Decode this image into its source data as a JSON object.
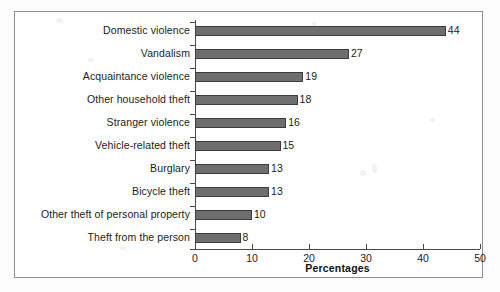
{
  "chart_data": {
    "type": "bar",
    "orientation": "horizontal",
    "title": "",
    "subtitle": "",
    "xlabel": "Percentages",
    "ylabel": "",
    "xlim": [
      0,
      50
    ],
    "xticks": [
      0,
      10,
      20,
      30,
      40,
      50
    ],
    "xtick_labels": [
      "0",
      "10",
      "20",
      "30",
      "40",
      "50"
    ],
    "grid": false,
    "legend": false,
    "legend_position": "none",
    "categories": [
      "Domestic violence",
      "Vandalism",
      "Acquaintance violence",
      "Other household theft",
      "Stranger violence",
      "Vehicle-related theft",
      "Burglary",
      "Bicycle theft",
      "Other theft of personal property",
      "Theft from the person"
    ],
    "values": [
      44,
      27,
      19,
      18,
      16,
      15,
      13,
      13,
      10,
      8
    ],
    "value_labels": [
      "44",
      "27",
      "19",
      "18",
      "16",
      "15",
      "13",
      "13",
      "10",
      "8"
    ],
    "bar_color": "#6e6e6e",
    "bar_edge_color": "#3d3d3d",
    "axis_color": "#4a4a4a",
    "text_color": "#1b1b1b",
    "background_color": "#ffffff"
  },
  "figure": {
    "frame_color": "#8e8e8e"
  }
}
